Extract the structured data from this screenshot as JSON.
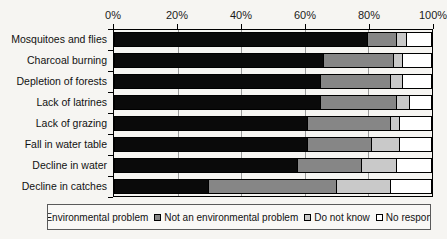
{
  "chart_data": {
    "type": "bar",
    "subtype": "horizontal-stacked-100",
    "title": "",
    "categories": [
      "Mosquitoes and flies",
      "Charcoal burning",
      "Depletion of forests",
      "Lack of latrines",
      "Lack of grazing",
      "Fall in water table",
      "Decline in water",
      "Decline in catches"
    ],
    "series": [
      {
        "name": "Environmental problem",
        "color": "#0a0a0a",
        "values": [
          80,
          66,
          65,
          65,
          61,
          61,
          58,
          30
        ]
      },
      {
        "name": "Not an environmental problem",
        "color": "#868686",
        "values": [
          9,
          22,
          22,
          24,
          26,
          20,
          20,
          40
        ]
      },
      {
        "name": "Do not know",
        "color": "#c9c9c9",
        "values": [
          3,
          3,
          4,
          4,
          3,
          9,
          11,
          17
        ]
      },
      {
        "name": "No response",
        "color": "#ffffff",
        "values": [
          8,
          9,
          9,
          7,
          10,
          10,
          11,
          13
        ]
      }
    ],
    "x_axis": {
      "min": 0,
      "max": 100,
      "tick_labels": [
        "0%",
        "20%",
        "40%",
        "60%",
        "80%",
        "100%"
      ],
      "position": "top"
    },
    "grid": true,
    "legend_position": "bottom"
  }
}
